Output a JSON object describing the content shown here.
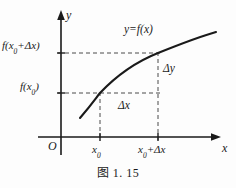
{
  "figure": {
    "caption": "图 1. 15",
    "background_color": "#fdfdfd",
    "ink_color": "#1a1a1a",
    "dash_color": "#4a4a4a"
  },
  "axes": {
    "y_axis_label": "y",
    "x_axis_label": "x",
    "origin_label": "O",
    "x_axis_y_px": 137,
    "y_axis_x_px": 61
  },
  "curve": {
    "label": "y=f(x)",
    "shape": "increasing concave-down"
  },
  "y_ticks": [
    {
      "name": "f-x0-delta-x",
      "text_main": "f(x",
      "text_sub": "0",
      "text_tail": "+Δx)",
      "y_px": 53
    },
    {
      "name": "f-x0",
      "text_main": "f(x",
      "text_sub": "0",
      "text_tail": ")",
      "y_px": 93
    }
  ],
  "x_ticks": [
    {
      "name": "x0",
      "text_main": "x",
      "text_sub": "0",
      "text_tail": "",
      "x_px": 100
    },
    {
      "name": "x0-delta-x",
      "text_main": "x",
      "text_sub": "0",
      "text_tail": "+Δx",
      "x_px": 158
    }
  ],
  "annotations": {
    "delta_y": "Δy",
    "delta_x": "Δx"
  },
  "points": [
    {
      "name": "point-x0",
      "x_px": 100,
      "y_px": 93
    },
    {
      "name": "point-x0-delta-x",
      "x_px": 158,
      "y_px": 53
    }
  ]
}
